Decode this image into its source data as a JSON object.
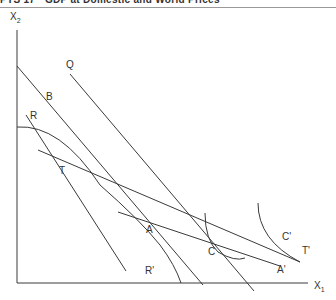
{
  "header": {
    "text": "PTS 17 · GDP at Domestic and World Prices"
  },
  "axes": {
    "y_label": "X",
    "y_sub": "2",
    "x_label": "X",
    "x_sub": "1"
  },
  "labels": {
    "Q": "Q",
    "B": "B",
    "R": "R",
    "T": "T",
    "A": "A",
    "C": "C",
    "C_prime": "C'",
    "T_prime": "T'",
    "A_prime": "A'",
    "R_prime": "R'"
  },
  "colors": {
    "line": "#3a3a3a",
    "text": "#333333"
  }
}
